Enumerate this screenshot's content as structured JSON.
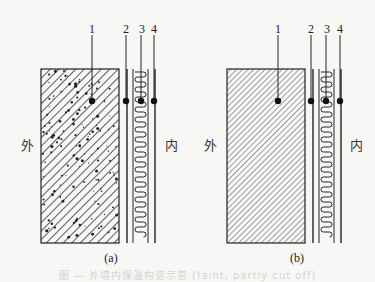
{
  "figure": {
    "panels": [
      {
        "id": "a",
        "sublabel": "(a)",
        "outside_label": "外",
        "inside_label": "内",
        "main_layer_pattern": "hatched-concrete",
        "callouts": [
          "1",
          "2",
          "3",
          "4"
        ]
      },
      {
        "id": "b",
        "sublabel": "(b)",
        "outside_label": "外",
        "inside_label": "内",
        "main_layer_pattern": "diagonal-hatch",
        "callouts": [
          "1",
          "2",
          "3",
          "4"
        ]
      }
    ],
    "caption": "图 — 外墙内保温构造示意 (faint, partly cut off)",
    "colors": {
      "ink": "#1a1a1a",
      "background": "#f7f7f5"
    }
  }
}
